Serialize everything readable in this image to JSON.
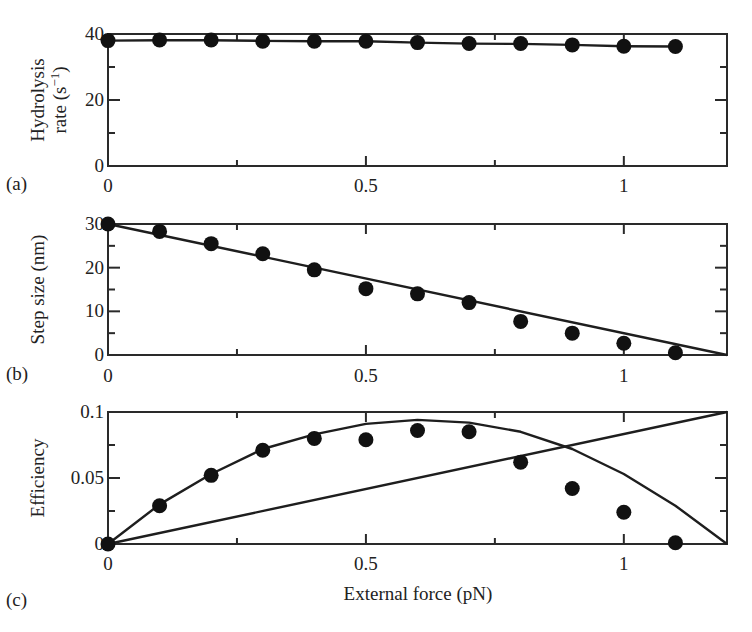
{
  "figure": {
    "xlabel": "External force (pN)",
    "x_ticks": [
      "0",
      "0.5",
      "1"
    ]
  },
  "chart_data": [
    {
      "panel": "(a)",
      "type": "line",
      "title": "",
      "xlabel": "",
      "ylabel_line1": "Hydrolysis",
      "ylabel_line2": "rate (s",
      "ylabel_sup": "−1",
      "ylabel_close": ")",
      "ylabel": "Hydrolysis rate (s⁻¹)",
      "xlim": [
        0,
        1.2
      ],
      "ylim": [
        0,
        40
      ],
      "x_tick_labels": [
        "0",
        "0.5",
        "1"
      ],
      "y_tick_labels": [
        "0",
        "20",
        "40"
      ],
      "grid": false,
      "series": [
        {
          "name": "data",
          "style": "points",
          "x": [
            0,
            0.1,
            0.2,
            0.3,
            0.4,
            0.5,
            0.6,
            0.7,
            0.8,
            0.9,
            1.0,
            1.1
          ],
          "values": [
            38,
            38.2,
            38.2,
            37.8,
            37.8,
            37.8,
            37.4,
            37.1,
            37.1,
            36.7,
            36.3,
            36.2
          ]
        },
        {
          "name": "model",
          "style": "line",
          "x": [
            0,
            0.1,
            0.2,
            0.3,
            0.4,
            0.5,
            0.6,
            0.7,
            0.8,
            0.9,
            1.0,
            1.1
          ],
          "values": [
            38,
            38.1,
            38.1,
            37.9,
            37.8,
            37.8,
            37.4,
            37.1,
            37.0,
            36.7,
            36.3,
            36.2
          ]
        }
      ]
    },
    {
      "panel": "(b)",
      "type": "line",
      "title": "",
      "xlabel": "",
      "ylabel": "Step size (nm)",
      "xlim": [
        0,
        1.2
      ],
      "ylim": [
        0,
        30
      ],
      "x_tick_labels": [
        "0",
        "0.5",
        "1"
      ],
      "y_tick_labels": [
        "0",
        "10",
        "20",
        "30"
      ],
      "grid": false,
      "series": [
        {
          "name": "data",
          "style": "points",
          "x": [
            0,
            0.1,
            0.2,
            0.3,
            0.4,
            0.5,
            0.6,
            0.7,
            0.8,
            0.9,
            1.0,
            1.1
          ],
          "values": [
            30,
            28.3,
            25.5,
            23.2,
            19.5,
            15.2,
            14,
            12,
            7.7,
            5,
            2.7,
            0.5
          ]
        },
        {
          "name": "linear fit",
          "style": "line",
          "x": [
            0,
            1.2
          ],
          "values": [
            30,
            0
          ]
        }
      ]
    },
    {
      "panel": "(c)",
      "type": "line",
      "title": "",
      "xlabel": "External force (pN)",
      "ylabel": "Efficiency",
      "xlim": [
        0,
        1.2
      ],
      "ylim": [
        0,
        0.1
      ],
      "x_tick_labels": [
        "0",
        "0.5",
        "1"
      ],
      "y_tick_labels": [
        "0",
        "0.05",
        "0.1"
      ],
      "grid": false,
      "series": [
        {
          "name": "data",
          "style": "points",
          "x": [
            0,
            0.1,
            0.2,
            0.3,
            0.4,
            0.5,
            0.6,
            0.7,
            0.8,
            0.9,
            1.0,
            1.1
          ],
          "values": [
            0,
            0.029,
            0.052,
            0.071,
            0.08,
            0.079,
            0.086,
            0.085,
            0.062,
            0.042,
            0.024,
            0.001
          ]
        },
        {
          "name": "model curve",
          "style": "line",
          "x": [
            0,
            0.1,
            0.2,
            0.3,
            0.4,
            0.5,
            0.6,
            0.7,
            0.8,
            0.9,
            1.0,
            1.1,
            1.2
          ],
          "values": [
            0,
            0.03,
            0.053,
            0.072,
            0.083,
            0.091,
            0.094,
            0.092,
            0.085,
            0.072,
            0.053,
            0.029,
            0
          ]
        },
        {
          "name": "linear",
          "style": "line",
          "x": [
            0,
            1.2
          ],
          "values": [
            0,
            0.1
          ]
        }
      ]
    }
  ]
}
